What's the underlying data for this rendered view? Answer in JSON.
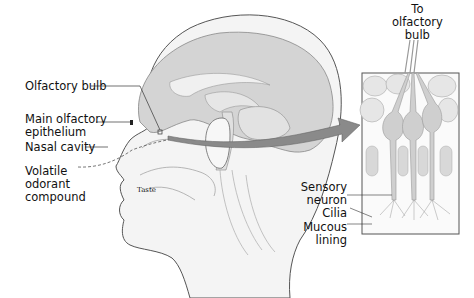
{
  "figure": {
    "labels": {
      "olfactory_bulb": "Olfactory bulb",
      "main_olfactory_epithelium": "Main olfactory\nepithelium",
      "nasal_cavity": "Nasal cavity",
      "volatile_odorant_compound": "Volatile\nodorant\ncompound",
      "taste": "Taste",
      "to_olfactory_bulb": "To\nolfactory\nbulb",
      "sensory_neuron": "Sensory\nneuron",
      "cilia": "Cilia",
      "mucous_lining": "Mucous\nlining"
    },
    "colors": {
      "brain": "#d4d4d4",
      "outline": "#555555",
      "arrow": "#8a8a8a",
      "cell": "#cfcfcf",
      "background": "#ffffff"
    }
  }
}
